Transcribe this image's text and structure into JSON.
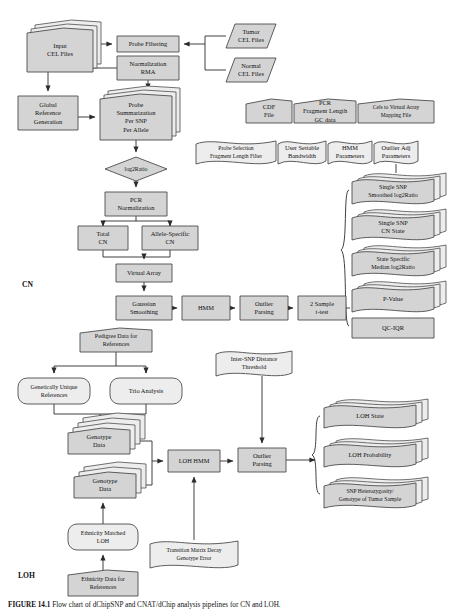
{
  "figure": {
    "caption_label": "FIGURE 14.1",
    "caption_text": "Flow chart of dChipSNP and CNAT/dChip analysis pipelines for CN and LOH."
  },
  "sections": [
    {
      "id": "cn",
      "label": "CN",
      "x": 22,
      "y": 287
    },
    {
      "id": "loh",
      "label": "LOH",
      "x": 18,
      "y": 578
    }
  ],
  "nodes": [
    {
      "id": "input-cel-files",
      "label": [
        "Input",
        "CEL Files"
      ],
      "shape": "stacked-doc",
      "x": 27,
      "y": 28,
      "w": 66,
      "h": 44
    },
    {
      "id": "probe-filtering",
      "label": [
        "Probe Filtering"
      ],
      "shape": "rect",
      "x": 117,
      "y": 36,
      "w": 62,
      "h": 16
    },
    {
      "id": "tumor-cel-files",
      "label": [
        "Tumor",
        "CEL Files"
      ],
      "shape": "parallelogram",
      "x": 226,
      "y": 24,
      "w": 50,
      "h": 24
    },
    {
      "id": "normal-cel-files",
      "label": [
        "Normal",
        "CEL Files"
      ],
      "shape": "parallelogram",
      "x": 226,
      "y": 58,
      "w": 50,
      "h": 24
    },
    {
      "id": "normalization-rma",
      "label": [
        "Normalization",
        "RMA"
      ],
      "shape": "rect",
      "x": 117,
      "y": 56,
      "w": 62,
      "h": 24
    },
    {
      "id": "global-reference-generation",
      "label": [
        "Global",
        "Reference",
        "Generation"
      ],
      "shape": "rect",
      "x": 18,
      "y": 96,
      "w": 60,
      "h": 34
    },
    {
      "id": "probe-summarization",
      "label": [
        "Probe",
        "Summarization",
        "Per SNP",
        "Per Allele"
      ],
      "shape": "stacked-doc",
      "x": 100,
      "y": 94,
      "w": 72,
      "h": 46
    },
    {
      "id": "cdf-file",
      "label": [
        "CDF",
        "File"
      ],
      "shape": "doc",
      "x": 246,
      "y": 99,
      "w": 46,
      "h": 24
    },
    {
      "id": "pcr-fragment-length-gc-data",
      "label": [
        "PCR",
        "Fragment Length",
        "GC data"
      ],
      "shape": "doc",
      "x": 294,
      "y": 99,
      "w": 62,
      "h": 24
    },
    {
      "id": "cels-to-virtual-array-mapping-file",
      "label": [
        "Cels to Virtual Array",
        "Mapping File"
      ],
      "shape": "doc",
      "x": 358,
      "y": 99,
      "w": 76,
      "h": 24
    },
    {
      "id": "probe-selection-fragment-length-filter",
      "label": [
        "Probe Selection",
        "Fragment Length Filter"
      ],
      "shape": "wavy-doc",
      "x": 196,
      "y": 140,
      "w": 80,
      "h": 24
    },
    {
      "id": "user-settable-bandwidth",
      "label": [
        "User Settable",
        "Bandwidth"
      ],
      "shape": "wavy-doc",
      "x": 278,
      "y": 140,
      "w": 48,
      "h": 24
    },
    {
      "id": "hmm-parameters",
      "label": [
        "HMM",
        "Parameters"
      ],
      "shape": "wavy-doc",
      "x": 328,
      "y": 140,
      "w": 44,
      "h": 24
    },
    {
      "id": "outlier-adj-parameters",
      "label": [
        "Outlier Adj",
        "Parameters",
        "x"
      ],
      "shape": "wavy-doc",
      "x": 374,
      "y": 140,
      "w": 44,
      "h": 24
    },
    {
      "id": "log2ratio",
      "label": [
        "log2Ratio"
      ],
      "shape": "diamond",
      "x": 105,
      "y": 157,
      "w": 62,
      "h": 24
    },
    {
      "id": "pcr-normalization",
      "label": [
        "PCR",
        "Normalization"
      ],
      "shape": "rect",
      "x": 105,
      "y": 192,
      "w": 62,
      "h": 24
    },
    {
      "id": "total-cn",
      "label": [
        "Total",
        "CN"
      ],
      "shape": "rect",
      "x": 78,
      "y": 226,
      "w": 50,
      "h": 24
    },
    {
      "id": "allele-specific-cn",
      "label": [
        "Allele-Specific",
        "CN"
      ],
      "shape": "rect",
      "x": 142,
      "y": 226,
      "w": 56,
      "h": 24
    },
    {
      "id": "virtual-array",
      "label": [
        "Virtual Array"
      ],
      "shape": "rect",
      "x": 116,
      "y": 264,
      "w": 56,
      "h": 18
    },
    {
      "id": "gaussian-smoothing",
      "label": [
        "Gaussian",
        "Smoothing"
      ],
      "shape": "rect",
      "x": 116,
      "y": 296,
      "w": 56,
      "h": 24
    },
    {
      "id": "hmm",
      "label": [
        "HMM"
      ],
      "shape": "rect",
      "x": 182,
      "y": 296,
      "w": 48,
      "h": 24
    },
    {
      "id": "outlier-parsing-cn",
      "label": [
        "Outlier",
        "Parsing"
      ],
      "shape": "rect",
      "x": 240,
      "y": 296,
      "w": 48,
      "h": 24
    },
    {
      "id": "two-sample-t-test",
      "label": [
        "2 Sample",
        "t-test"
      ],
      "shape": "rect",
      "x": 298,
      "y": 296,
      "w": 48,
      "h": 24
    },
    {
      "id": "single-snp-smoothed-log2ratio",
      "label": [
        "Single SNP",
        "Smoothed log2Ratio"
      ],
      "shape": "stacked-wavy",
      "x": 352,
      "y": 178,
      "w": 82,
      "h": 26
    },
    {
      "id": "single-snp-cn-state",
      "label": [
        "Single SNP",
        "CN State"
      ],
      "shape": "stacked-wavy",
      "x": 352,
      "y": 214,
      "w": 82,
      "h": 26
    },
    {
      "id": "state-specific-median-log2ratio",
      "label": [
        "State Specific",
        "Median log2Ratio"
      ],
      "shape": "stacked-wavy",
      "x": 352,
      "y": 250,
      "w": 82,
      "h": 26
    },
    {
      "id": "p-value",
      "label": [
        "P-Value"
      ],
      "shape": "stacked-wavy",
      "x": 352,
      "y": 286,
      "w": 82,
      "h": 26
    },
    {
      "id": "qc-iqr",
      "label": [
        "QC-IQR"
      ],
      "shape": "rect",
      "x": 352,
      "y": 318,
      "w": 82,
      "h": 20
    },
    {
      "id": "pedigree-data-for-references",
      "label": [
        "Pedigree Data for",
        "References"
      ],
      "shape": "doc",
      "x": 80,
      "y": 328,
      "w": 72,
      "h": 24
    },
    {
      "id": "inter-snp-distance-threshold",
      "label": [
        "Inter-SNP Distance",
        "Threshold",
        "x"
      ],
      "shape": "wavy-doc",
      "x": 216,
      "y": 350,
      "w": 76,
      "h": 26
    },
    {
      "id": "genetically-unique-references",
      "label": [
        "Genetically Unique",
        "References"
      ],
      "shape": "rounded",
      "x": 18,
      "y": 378,
      "w": 72,
      "h": 26
    },
    {
      "id": "trio-analysis",
      "label": [
        "Trio Analysis"
      ],
      "shape": "rounded",
      "x": 110,
      "y": 378,
      "w": 72,
      "h": 26
    },
    {
      "id": "genotype-data-1",
      "label": [
        "Genotype",
        "Data"
      ],
      "shape": "stacked-doc4",
      "x": 68,
      "y": 428,
      "w": 62,
      "h": 26
    },
    {
      "id": "genotype-data-2",
      "label": [
        "Genotype",
        "Data"
      ],
      "shape": "stacked-doc2",
      "x": 74,
      "y": 472,
      "w": 62,
      "h": 26
    },
    {
      "id": "loh-hmm",
      "label": [
        "LOH HMM"
      ],
      "shape": "rect",
      "x": 168,
      "y": 450,
      "w": 52,
      "h": 22
    },
    {
      "id": "outlier-parsing-loh",
      "label": [
        "Outlier",
        "Parsing"
      ],
      "shape": "rect",
      "x": 238,
      "y": 448,
      "w": 48,
      "h": 24
    },
    {
      "id": "loh-state",
      "label": [
        "LOH State"
      ],
      "shape": "stacked-wavy",
      "x": 324,
      "y": 404,
      "w": 92,
      "h": 24
    },
    {
      "id": "loh-probability",
      "label": [
        "LOH Probability"
      ],
      "shape": "stacked-wavy",
      "x": 324,
      "y": 443,
      "w": 92,
      "h": 24
    },
    {
      "id": "snp-heterozygosity",
      "label": [
        "SNP Heterozygosity/",
        "Genotype of Tumor Sample"
      ],
      "shape": "stacked-wavy",
      "x": 324,
      "y": 482,
      "w": 92,
      "h": 26
    },
    {
      "id": "ethnicity-matched-loh",
      "label": [
        "Ethnicity Matched",
        "LOH"
      ],
      "shape": "rounded",
      "x": 68,
      "y": 524,
      "w": 70,
      "h": 26
    },
    {
      "id": "transition-matrix-decay-genotype-error",
      "label": [
        "Transition Matrix Decay",
        "Genotype Error"
      ],
      "shape": "wavy-doc",
      "x": 150,
      "y": 540,
      "w": 88,
      "h": 28
    },
    {
      "id": "ethnicity-data-for-references",
      "label": [
        "Ethnicity Data for",
        "References"
      ],
      "shape": "doc",
      "x": 68,
      "y": 570,
      "w": 70,
      "h": 26
    }
  ],
  "colors": {
    "node_fill": "#d4d4d4",
    "node_fill_light": "#ededed",
    "stroke": "#4d4d4d",
    "text": "#111111",
    "background": "#ffffff"
  }
}
